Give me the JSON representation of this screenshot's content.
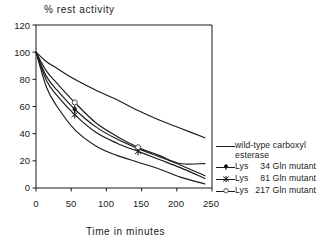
{
  "chart_data": {
    "type": "line",
    "title": "% rest activity",
    "xlabel": "Time in minutes",
    "ylabel": "",
    "xlim": [
      0,
      250
    ],
    "ylim": [
      0,
      120
    ],
    "xticks": [
      0,
      50,
      100,
      150,
      200,
      250
    ],
    "yticks": [
      0,
      20,
      40,
      60,
      80,
      100,
      120
    ],
    "grid": false,
    "legend_position": "right",
    "series": [
      {
        "name": "wild-type carboxyl esterase",
        "marker": "none",
        "x": [
          0,
          15,
          30,
          55,
          85,
          115,
          145,
          175,
          205,
          240
        ],
        "y": [
          100,
          93,
          88,
          80,
          72,
          65,
          57,
          50,
          44,
          37
        ]
      },
      {
        "name": "Lys 34 Gln mutant",
        "marker": "filled-plus-dot",
        "x": [
          0,
          15,
          30,
          55,
          85,
          115,
          145,
          175,
          205,
          240
        ],
        "y": [
          100,
          82,
          72,
          58,
          45,
          36,
          29,
          23,
          17,
          9
        ]
      },
      {
        "name": "Lys 81 Gln mutant",
        "marker": "asterisk",
        "x": [
          0,
          15,
          30,
          55,
          85,
          115,
          145,
          175,
          205,
          240
        ],
        "y": [
          100,
          79,
          68,
          54,
          41,
          33,
          27,
          21,
          15,
          7
        ]
      },
      {
        "name": "Lys 217 Gln mutant",
        "marker": "open-circle",
        "x": [
          0,
          15,
          30,
          55,
          85,
          115,
          145,
          175,
          205,
          240
        ],
        "y": [
          100,
          86,
          77,
          63,
          48,
          38,
          30,
          24,
          18,
          18
        ]
      },
      {
        "name": "lower-decay-curve",
        "marker": "none",
        "x": [
          0,
          15,
          30,
          55,
          85,
          115,
          145,
          175,
          205,
          240
        ],
        "y": [
          100,
          74,
          60,
          43,
          31,
          24,
          19,
          14,
          8,
          3
        ]
      }
    ]
  },
  "axes": {
    "y_tick_labels": [
      "120",
      "100",
      "80",
      "60",
      "40",
      "20",
      "0"
    ],
    "x_tick_labels": [
      "0",
      "50",
      "100",
      "150",
      "200",
      "250"
    ]
  },
  "legend": {
    "entries": [
      {
        "label_line1": "wild-type  carboxyl",
        "label_line2": "esterase",
        "marker": "none"
      },
      {
        "label_lys": "Lys",
        "label_num": "34",
        "label_tail": "Gln  mutant",
        "marker": "filled-plus-dot"
      },
      {
        "label_lys": "Lys",
        "label_num": "81",
        "label_tail": "Gln  mutant",
        "marker": "asterisk"
      },
      {
        "label_lys": "Lys",
        "label_num": "217",
        "label_tail": "Gln  mutant",
        "marker": "open-circle"
      }
    ]
  },
  "colors": {
    "ink": "#1a1a1a",
    "background": "#ffffff"
  }
}
